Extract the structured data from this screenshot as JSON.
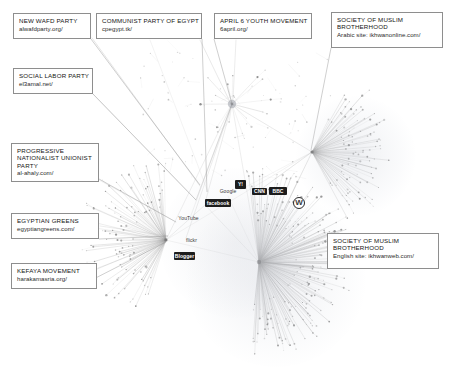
{
  "figure": {
    "type": "network-graph",
    "background": "#ffffff",
    "edge_color": "#9a9a9a",
    "node_color": "#6e6e6e",
    "callout_border": "#8e8e8e"
  },
  "callouts": [
    {
      "id": "new-wafd-party",
      "org": "NEW WAFD PARTY",
      "url": "alwafdparty.org/",
      "x": 13,
      "y": 13,
      "w": 78,
      "h": 26,
      "leader_to": {
        "x": 200,
        "y": 185
      }
    },
    {
      "id": "communist-party-of-egypt",
      "org": "COMMUNIST PARTY OF EGYPT",
      "url": "cpegypt.tk/",
      "x": 96,
      "y": 13,
      "w": 106,
      "h": 26,
      "leader_to": {
        "x": 207,
        "y": 192
      }
    },
    {
      "id": "april-6-youth-movement",
      "org": "APRIL 6 YOUTH MOVEMENT",
      "url": "6april.org/",
      "x": 214,
      "y": 13,
      "w": 98,
      "h": 26,
      "leader_to": {
        "x": 232,
        "y": 104
      }
    },
    {
      "id": "society-of-muslim-brotherhood-arabic",
      "org": "SOCIETY OF MUSLIM BROTHERHOOD",
      "url": "Arabic site: ikhwanonline.com/",
      "x": 331,
      "y": 12,
      "w": 112,
      "h": 36,
      "leader_to": {
        "x": 311,
        "y": 150
      },
      "wrap": true
    },
    {
      "id": "social-labor-party",
      "org": "SOCIAL LABOR PARTY",
      "url": "el3amal.net/",
      "x": 13,
      "y": 68,
      "w": 80,
      "h": 26,
      "leader_to": {
        "x": 196,
        "y": 200
      }
    },
    {
      "id": "progressive-nationalist-unionist-party",
      "org": "PROGRESSIVE NATIONALIST UNIONIST PARTY",
      "url": "al-ahaly.com/",
      "x": 11,
      "y": 143,
      "w": 88,
      "h": 36,
      "leader_to": {
        "x": 176,
        "y": 222
      },
      "wrap": true
    },
    {
      "id": "egyptian-greens",
      "org": "EGYPTIAN GREENS",
      "url": "egyptiangreens.com/",
      "x": 11,
      "y": 213,
      "w": 88,
      "h": 26,
      "leader_to": {
        "x": 168,
        "y": 236
      }
    },
    {
      "id": "kefaya-movement",
      "org": "KEFAYA MOVEMENT",
      "url": "harakamasria.org/",
      "x": 11,
      "y": 263,
      "w": 86,
      "h": 26,
      "leader_to": {
        "x": 166,
        "y": 242
      }
    },
    {
      "id": "society-of-muslim-brotherhood-english",
      "org": "SOCIETY OF MUSLIM BROTHERHOOD",
      "url": "English site: ikhwanweb.com/",
      "x": 327,
      "y": 233,
      "w": 112,
      "h": 36,
      "leader_to": {
        "x": 262,
        "y": 262
      },
      "wrap": true
    }
  ],
  "logos": [
    {
      "id": "google-logo",
      "label": "Google",
      "style": "plain",
      "x": 213,
      "y": 187,
      "w": 30,
      "h": 9
    },
    {
      "id": "yahoo-logo",
      "label": "Y!",
      "style": "dark",
      "x": 235,
      "y": 180,
      "w": 11,
      "h": 9
    },
    {
      "id": "cnn-logo",
      "label": "CNN",
      "style": "dark",
      "x": 252,
      "y": 188,
      "w": 15,
      "h": 7
    },
    {
      "id": "bbc-logo",
      "label": "BBC",
      "style": "dark",
      "x": 269,
      "y": 187,
      "w": 18,
      "h": 8
    },
    {
      "id": "facebook-logo",
      "label": "facebook",
      "style": "dark",
      "x": 205,
      "y": 199,
      "w": 26,
      "h": 8
    },
    {
      "id": "youtube-logo",
      "label": "YouTube",
      "style": "plain",
      "x": 180,
      "y": 214,
      "w": 17,
      "h": 9
    },
    {
      "id": "flickr-logo",
      "label": "flickr",
      "style": "plain",
      "x": 182,
      "y": 236,
      "w": 19,
      "h": 8
    },
    {
      "id": "blogger-logo",
      "label": "Blogger",
      "style": "dark",
      "x": 174,
      "y": 252,
      "w": 21,
      "h": 8
    },
    {
      "id": "wordpress-logo",
      "label": "W",
      "style": "plain",
      "x": 293,
      "y": 197,
      "w": 12,
      "h": 12
    }
  ],
  "hubs": [
    {
      "id": "hub-muslim-brotherhood-english",
      "cx": 259,
      "cy": 262,
      "spokes": 150,
      "radius": 92,
      "start_deg": -96,
      "end_deg": 96,
      "weight": "heavy"
    },
    {
      "id": "hub-muslim-brotherhood-arabic",
      "cx": 312,
      "cy": 152,
      "spokes": 70,
      "radius": 78,
      "start_deg": -62,
      "end_deg": 62,
      "weight": "medium"
    },
    {
      "id": "hub-kefaya-greens",
      "cx": 166,
      "cy": 240,
      "spokes": 80,
      "radius": 80,
      "start_deg": 108,
      "end_deg": 268,
      "weight": "medium"
    },
    {
      "id": "hub-central-small",
      "cx": 232,
      "cy": 104,
      "spokes": 14,
      "radius": 40,
      "start_deg": 0,
      "end_deg": 360,
      "weight": "light"
    }
  ]
}
